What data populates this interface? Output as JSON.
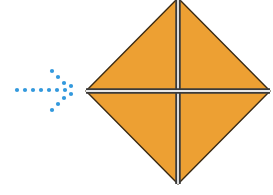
{
  "figure": {
    "title": "Folding step diagram",
    "background_color": "#ffffff",
    "canvas": {
      "width": 273,
      "height": 195
    }
  },
  "arrow": {
    "name": "dotted-arrow-right",
    "direction": "right",
    "style": "dotted",
    "dot_color": "#3399dd",
    "dot_radius": 2.1,
    "shaft_dots": [
      {
        "x": 17,
        "y": 90
      },
      {
        "x": 25,
        "y": 90
      },
      {
        "x": 33,
        "y": 90
      },
      {
        "x": 41,
        "y": 90
      },
      {
        "x": 49,
        "y": 90
      },
      {
        "x": 57,
        "y": 90
      },
      {
        "x": 65,
        "y": 90
      }
    ],
    "upper_arm_dots": [
      {
        "x": 52,
        "y": 71
      },
      {
        "x": 58,
        "y": 77
      },
      {
        "x": 64,
        "y": 83
      }
    ],
    "lower_arm_dots": [
      {
        "x": 52,
        "y": 110
      },
      {
        "x": 58,
        "y": 104
      },
      {
        "x": 64,
        "y": 98
      }
    ],
    "tip_dots": [
      {
        "x": 71,
        "y": 86
      },
      {
        "x": 71,
        "y": 94
      }
    ]
  },
  "diamond": {
    "name": "orange-diamond",
    "shape": "square rotated 45 degrees",
    "fill_color": "#eda033",
    "outline_color": "#3a2a14",
    "outline_width": 1.4,
    "vertices": {
      "left": {
        "x": 86,
        "y": 91
      },
      "top": {
        "x": 178,
        "y": -2
      },
      "right": {
        "x": 270,
        "y": 91
      },
      "bottom": {
        "x": 178,
        "y": 184
      }
    },
    "clipped_edges": [
      "top",
      "bottom"
    ]
  },
  "crease_lines": {
    "name": "crease-cross",
    "count": 2,
    "dark_color": "#3b3b3b",
    "light_color": "#e8e8e8",
    "band_width": 5.5,
    "vertical": {
      "name": "vertical-crease",
      "x": 178,
      "y_start": -2,
      "y_end": 184
    },
    "horizontal": {
      "name": "horizontal-crease",
      "y": 91,
      "x_start": 86,
      "x_end": 270
    }
  }
}
